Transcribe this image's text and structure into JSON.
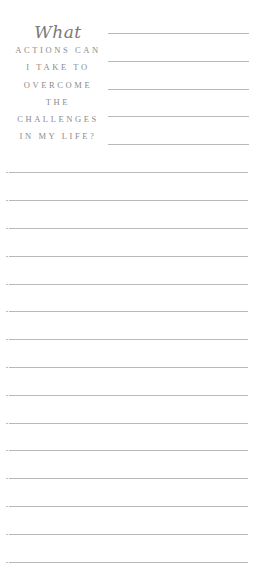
{
  "prompt": {
    "script_word": "What",
    "lines": [
      "ACTIONS CAN",
      "I TAKE TO",
      "OVERCOME",
      "THE",
      "CHALLENGES",
      "IN MY LIFE?"
    ]
  },
  "short_rules_y": [
    33,
    61,
    89,
    116,
    144
  ],
  "full_rules_y": [
    172,
    200,
    228,
    256,
    284,
    311,
    339,
    367,
    395,
    423,
    450,
    478,
    506,
    534,
    562
  ],
  "colors": {
    "text": "#8a8a8a",
    "rule": "#b8b8b8",
    "background": "#ffffff"
  }
}
